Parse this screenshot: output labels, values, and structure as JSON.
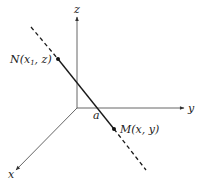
{
  "diagram": {
    "type": "3d-axes-line",
    "axes": {
      "x": {
        "label": "x"
      },
      "y": {
        "label": "y"
      },
      "z": {
        "label": "z"
      }
    },
    "points": {
      "N": {
        "label": "N",
        "coords_prefix": "(x",
        "coords_sub": "1",
        "coords_suffix": ", z)"
      },
      "M": {
        "label": "M",
        "coords": "(x, y)"
      }
    },
    "intercept_label": "a",
    "colors": {
      "axis": "#555555",
      "line": "#1a1a1a",
      "background": "#ffffff"
    }
  }
}
